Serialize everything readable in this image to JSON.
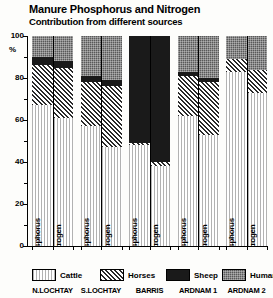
{
  "chart": {
    "title": "Manure Phosphorus and Nitrogen",
    "subtitle": "Contribution from different sources",
    "percent_symbol": "%"
  },
  "chart_data": {
    "type": "bar",
    "stacked": true,
    "title": "Manure Phosphorus and Nitrogen",
    "subtitle": "Contribution from different sources",
    "xlabel": "",
    "ylabel": "%",
    "ylim": [
      0,
      100
    ],
    "yticks": [
      0,
      20,
      40,
      60,
      80,
      100
    ],
    "ytick_labels": [
      "0",
      "20",
      "40",
      "60",
      "80",
      "100"
    ],
    "minor_ticks": [
      10,
      30,
      50,
      70,
      90
    ],
    "grid": false,
    "legend_position": "bottom",
    "categories": [
      "N.LOCHTAY",
      "S.LOCHTAY",
      "BARRIS",
      "ARDNAM 1",
      "ARDNAM 2"
    ],
    "sub_categories": [
      "Phosphorus",
      "Nitrogen"
    ],
    "series": [
      {
        "name": "Cattle",
        "color": "#ffffff",
        "pattern": "fine-vertical-lines",
        "values": {
          "Phosphorus": [
            67,
            57,
            48,
            62,
            83
          ],
          "Nitrogen": [
            61,
            47,
            38,
            53,
            73
          ]
        }
      },
      {
        "name": "Horses",
        "color": "#f2f2f2",
        "pattern": "diagonal-hatch",
        "values": {
          "Phosphorus": [
            19,
            21,
            1,
            19,
            6
          ],
          "Nitrogen": [
            24,
            29,
            2,
            25,
            11
          ]
        }
      },
      {
        "name": "Sheep",
        "color": "#1a1a1a",
        "pattern": "solid-black",
        "values": {
          "Phosphorus": [
            4,
            3,
            51,
            2,
            0
          ],
          "Nitrogen": [
            3,
            3,
            60,
            2,
            0
          ]
        }
      },
      {
        "name": "Humans",
        "color": "#595959",
        "pattern": "dotted-gray",
        "values": {
          "Phosphorus": [
            10,
            19,
            0,
            17,
            11
          ],
          "Nitrogen": [
            12,
            21,
            0,
            20,
            16
          ]
        }
      }
    ]
  },
  "legend": {
    "items": [
      {
        "label": "Cattle",
        "fill": "f-cattle"
      },
      {
        "label": "Horses",
        "fill": "f-horses"
      },
      {
        "label": "Sheep",
        "fill": "f-sheep"
      },
      {
        "label": "Humans",
        "fill": "f-humans"
      }
    ]
  }
}
